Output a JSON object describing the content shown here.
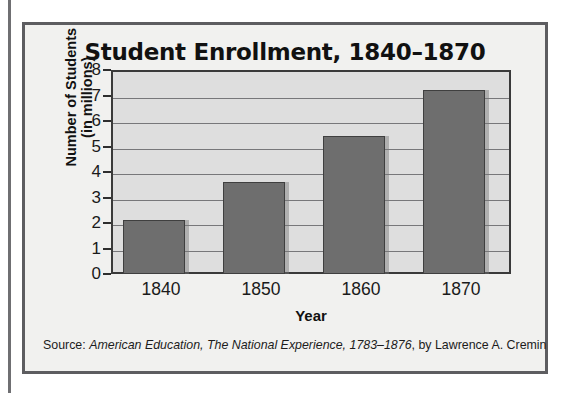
{
  "figure": {
    "title": "Student Enrollment, 1840–1870",
    "source_prefix": "Source: ",
    "source_title": "American Education, The National Experience, 1783–1876",
    "source_suffix": ", by Lawrence A. Cremin"
  },
  "axes": {
    "y_title_line1": "Number of Students",
    "y_title_line2": "(in millions)",
    "x_title": "Year"
  },
  "colors": {
    "bar_fill": "#6e6e6e",
    "bar_outline": "#3f3f3f",
    "plot_background": "#dedede",
    "gridline": "#77777a",
    "frame": "#3a3a3a",
    "page_background": "#f1f1ef",
    "box_border": "#5d5d60",
    "text": "#111111"
  },
  "chart_data": {
    "type": "bar",
    "title": "Student Enrollment, 1840–1870",
    "xlabel": "Year",
    "ylabel": "Number of Students (in millions)",
    "categories": [
      "1840",
      "1850",
      "1860",
      "1870"
    ],
    "values": [
      2.1,
      3.6,
      5.4,
      7.2
    ],
    "ylim": [
      0,
      8
    ],
    "yticks": [
      0,
      1,
      2,
      3,
      4,
      5,
      6,
      7,
      8
    ],
    "ytick_labels": [
      "0",
      "1",
      "2",
      "3",
      "4",
      "5",
      "6",
      "7",
      "8"
    ],
    "grid": true,
    "grid_axis": "y",
    "legend": false,
    "units": "millions of students",
    "source": "Source: American Education, The National Experience, 1783–1876, by Lawrence A. Cremin"
  }
}
